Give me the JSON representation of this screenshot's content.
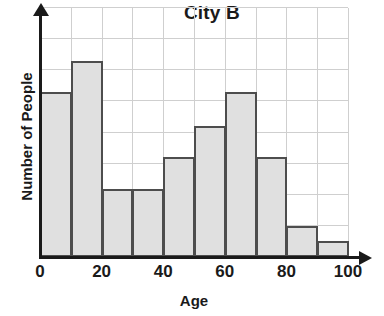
{
  "chart_data": {
    "type": "bar",
    "title": "City B",
    "xlabel": "Age",
    "ylabel": "Number of People",
    "grid": true,
    "legend": false,
    "xlim": [
      0,
      100
    ],
    "ylim": [
      0,
      8
    ],
    "xticks": [
      "0",
      "20",
      "40",
      "60",
      "80",
      "100"
    ],
    "xtick_values": [
      0,
      20,
      40,
      60,
      80,
      100
    ],
    "yticks": [],
    "bin_width": 10,
    "bin_edges": [
      0,
      10,
      20,
      30,
      40,
      50,
      60,
      70,
      80,
      90,
      100
    ],
    "categories": [
      "0-10",
      "10-20",
      "20-30",
      "30-40",
      "40-50",
      "50-60",
      "60-70",
      "70-80",
      "80-90",
      "90-100"
    ],
    "values": [
      5.3,
      6.3,
      2.2,
      2.2,
      3.2,
      4.2,
      5.3,
      3.2,
      1.0,
      0.5
    ],
    "bar_fill_color": "#e0e0e0",
    "bar_edge_color": "#4d4d4d",
    "grid_color": "#cfcfcf",
    "axis_color": "#1a1a1a"
  }
}
